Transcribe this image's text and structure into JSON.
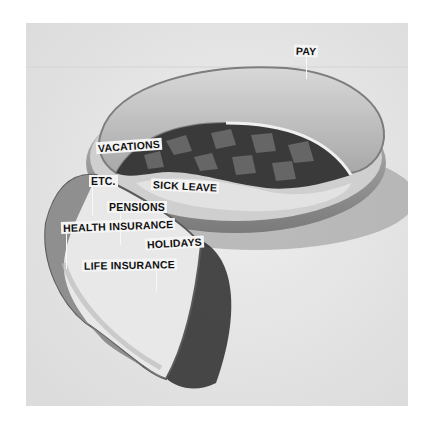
{
  "photo": {
    "description": "Black-and-white photograph of a pie in a glass dish with one slice cut out and set aside; paper flags label the pieces",
    "colors": {
      "background": "#e6e6e6",
      "crust": "#cfcfcf",
      "filling": "#3a3a3a",
      "shadow": "#2a2a2a",
      "flag": "#f4f4f4",
      "text": "#111111"
    }
  },
  "labels": {
    "pay": "PAY",
    "vacations": "VACATIONS",
    "etc": "ETC.",
    "sick_leave": "SICK LEAVE",
    "pensions": "PENSIONS",
    "health_insurance": "HEALTH INSURANCE",
    "holidays": "HOLIDAYS",
    "life_insurance": "LIFE INSURANCE"
  }
}
